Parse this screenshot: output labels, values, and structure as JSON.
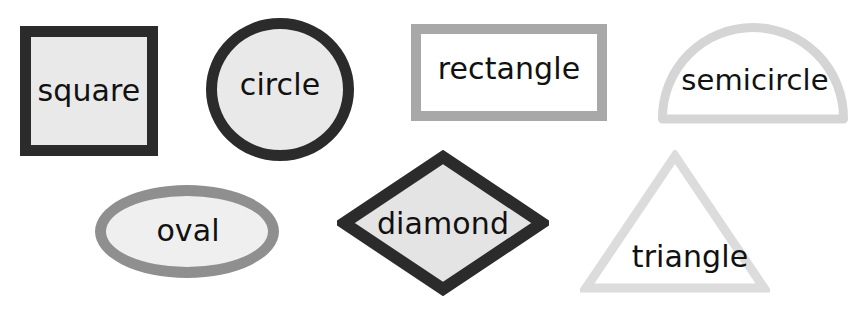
{
  "canvas": {
    "width": 856,
    "height": 317,
    "background": "#ffffff",
    "title": "Shapes"
  },
  "palette": {
    "text": "#111111",
    "dark_outline": "#2b2b2b",
    "mid_outline": "#8f8f8f",
    "light_outline": "#a8a8a8",
    "pale_outline": "#d5d5d5",
    "palest_outline": "#dcdcdc",
    "light_fill": "#e9e9e9",
    "white_fill": "#ffffff"
  },
  "shapes": [
    {
      "id": "square",
      "label": "square",
      "outline": "#2b2b2b",
      "fill": "#e9e9e9",
      "stroke_width": 11,
      "label_font_size": 30,
      "label_x": 89,
      "label_y": 91
    },
    {
      "id": "circle",
      "label": "circle",
      "outline": "#2b2b2b",
      "fill": "#e9e9e9",
      "stroke_width": 11,
      "label_font_size": 30,
      "label_x": 280,
      "label_y": 85
    },
    {
      "id": "rectangle",
      "label": "rectangle",
      "outline": "#a8a8a8",
      "fill": "#ffffff",
      "stroke_width": 10,
      "label_font_size": 30,
      "label_x": 509,
      "label_y": 69
    },
    {
      "id": "semicircle",
      "label": "semicircle",
      "outline": "#d5d5d5",
      "fill": "#ffffff",
      "stroke_width": 9,
      "label_font_size": 29,
      "label_x": 755,
      "label_y": 80
    },
    {
      "id": "oval",
      "label": "oval",
      "outline": "#8f8f8f",
      "fill": "#efefef",
      "stroke_width": 11,
      "label_font_size": 30,
      "label_x": 188,
      "label_y": 231
    },
    {
      "id": "diamond",
      "label": "diamond",
      "outline": "#2b2b2b",
      "fill": "#e4e4e4",
      "stroke_width": 12,
      "label_font_size": 30,
      "label_x": 443,
      "label_y": 224
    },
    {
      "id": "triangle",
      "label": "triangle",
      "outline": "#dcdcdc",
      "fill": "#ffffff",
      "stroke_width": 9,
      "label_font_size": 30,
      "label_x": 690,
      "label_y": 257
    }
  ]
}
